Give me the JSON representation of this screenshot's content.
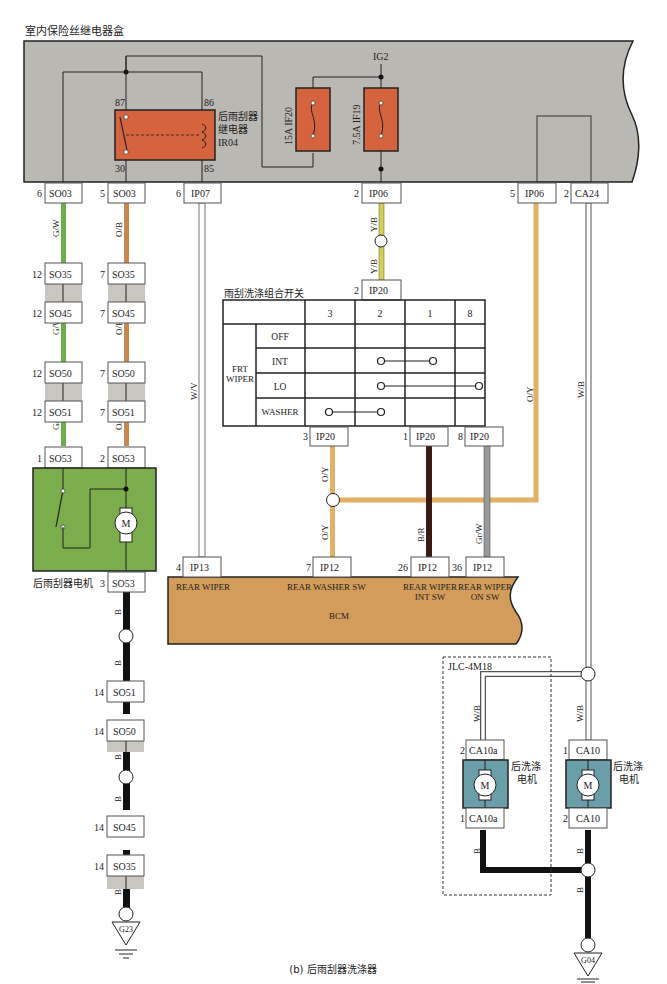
{
  "title": "室内保险丝继电器盒",
  "caption": "(b) 后雨刮器洗涤器",
  "colors": {
    "fuse_box_fill": "#bab8b3",
    "relay_fill": "#d4633e",
    "motor_fill": "#7cad4d",
    "washer_motor_fill": "#6a9ea9",
    "bcm_fill": "#d49c5a",
    "wire_gw": "#6fae4a",
    "wire_ob": "#c8884a",
    "wire_yb": "#d6d04a",
    "wire_oy": "#e3b064",
    "wire_br": "#3a1a12",
    "wire_b": "#111111",
    "wire_grw": "#9a9a9a",
    "wire_w": "#ffffff"
  },
  "fuse_box": {
    "ig2_label": "IG2",
    "relay": {
      "name_line1": "后雨刮器",
      "name_line2": "继电器",
      "code": "IR04",
      "pin_87": "87",
      "pin_86": "86",
      "pin_30": "30",
      "pin_85": "85"
    },
    "fuse_if20": "15A IF20",
    "fuse_if19": "7.5A IF19"
  },
  "top_connectors": [
    {
      "pin": "6",
      "code": "SO03"
    },
    {
      "pin": "5",
      "code": "SO03"
    },
    {
      "pin": "6",
      "code": "IP07"
    },
    {
      "pin": "2",
      "code": "IP06"
    },
    {
      "pin": "5",
      "code": "IP06"
    },
    {
      "pin": "2",
      "code": "CA24"
    }
  ],
  "wire_labels": {
    "gw": "G/W",
    "ob": "O/B",
    "wv": "W/V",
    "yb": "Y/B",
    "oy": "O/Y",
    "wb": "W/B",
    "br": "B/R",
    "grw": "Gr/W",
    "b": "B"
  },
  "left_chain": {
    "gw_pins": [
      "12",
      "12",
      "12",
      "12",
      "1"
    ],
    "ob_pins": [
      "7",
      "7",
      "7",
      "7",
      "2"
    ],
    "codes": [
      "SO35",
      "SO45",
      "SO50",
      "SO51",
      "SO53"
    ]
  },
  "wiper_motor": {
    "label": "后雨刮器电机",
    "motor_symbol": "M",
    "out_pin": "3",
    "out_code": "SO53"
  },
  "ground_chain": {
    "pins": [
      "14",
      "14",
      "14",
      "14"
    ],
    "codes": [
      "SO51",
      "SO50",
      "SO45",
      "SO35"
    ],
    "ground_left": "G23",
    "ground_right": "G04"
  },
  "switch": {
    "title": "雨刮洗涤组合开关",
    "in_pin": "2",
    "in_code": "IP20",
    "group_label_line1": "FRT",
    "group_label_line2": "WIPER",
    "columns": [
      "3",
      "2",
      "1",
      "8"
    ],
    "rows": [
      "OFF",
      "INT",
      "LO",
      "WASHER"
    ],
    "out_connectors": [
      {
        "pin": "3",
        "code": "IP20"
      },
      {
        "pin": "1",
        "code": "IP20"
      },
      {
        "pin": "8",
        "code": "IP20"
      }
    ]
  },
  "bcm": {
    "label": "BCM",
    "connectors": [
      {
        "pin": "4",
        "code": "IP13",
        "func": "REAR WIPER",
        "func2": ""
      },
      {
        "pin": "7",
        "code": "IP12",
        "func": "REAR WASHER SW",
        "func2": ""
      },
      {
        "pin": "26",
        "code": "IP12",
        "func": "REAR WIPER",
        "func2": "INT SW"
      },
      {
        "pin": "36",
        "code": "IP12",
        "func": "REAR WIPER",
        "func2": "ON SW"
      }
    ]
  },
  "washer": {
    "group_label": "JLC-4M18",
    "left_motor": {
      "top_pin": "2",
      "top_code": "CA10a",
      "bot_pin": "1",
      "bot_code": "CA10a",
      "label1": "后洗涤",
      "label2": "电机",
      "symbol": "M"
    },
    "right_motor": {
      "top_pin": "1",
      "top_code": "CA10",
      "bot_pin": "2",
      "bot_code": "CA10",
      "label1": "后洗涤",
      "label2": "电机",
      "symbol": "M"
    }
  }
}
